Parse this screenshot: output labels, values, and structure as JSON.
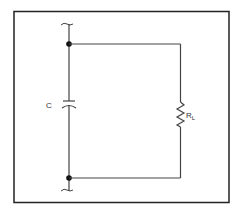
{
  "diagram": {
    "type": "circuit-schematic",
    "components": [
      {
        "id": "C",
        "kind": "capacitor",
        "label": "C",
        "position": "left-branch"
      },
      {
        "id": "RL",
        "kind": "resistor",
        "label": "R",
        "subscript": "L",
        "position": "right-branch"
      }
    ],
    "junctions": [
      {
        "id": "top-junction",
        "position": "top-left"
      },
      {
        "id": "bottom-junction",
        "position": "bottom-left"
      }
    ],
    "terminals": [
      {
        "id": "top-terminal",
        "style": "wavy-break"
      },
      {
        "id": "bottom-terminal",
        "style": "wavy-break"
      }
    ],
    "colors": {
      "stroke": "#3a3a3a",
      "border": "#222222",
      "background": "#ffffff"
    }
  }
}
